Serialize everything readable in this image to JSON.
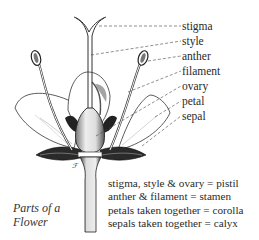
{
  "diagram": {
    "title_line1": "Parts of a",
    "title_line2": "Flower",
    "labels": [
      {
        "id": "stigma",
        "text": "stigma",
        "y": 27
      },
      {
        "id": "style",
        "text": "style",
        "y": 42
      },
      {
        "id": "anther",
        "text": "anther",
        "y": 56
      },
      {
        "id": "filament",
        "text": "filament",
        "y": 71
      },
      {
        "id": "ovary",
        "text": "ovary",
        "y": 86
      },
      {
        "id": "petal",
        "text": "petal",
        "y": 101
      },
      {
        "id": "sepal",
        "text": "sepal",
        "y": 116
      }
    ],
    "summary": [
      "stigma, style & ovary = pistil",
      "anther & filament = stamen",
      "petals taken together = corolla",
      "sepals taken together = calyx"
    ],
    "signature": "ℱ"
  }
}
